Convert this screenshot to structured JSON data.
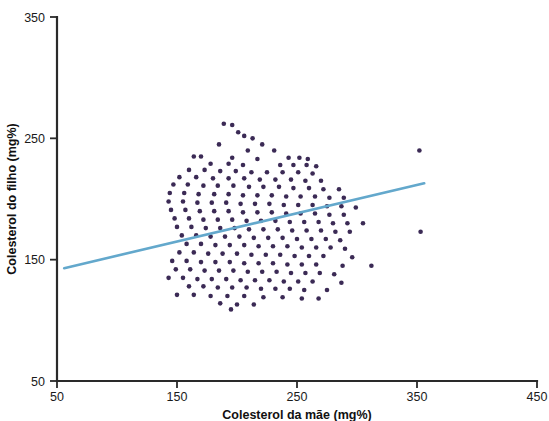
{
  "chart_data": {
    "type": "scatter",
    "title": "",
    "xlabel": "Colesterol da mãe (mg%)",
    "ylabel": "Colesterol do filho (mg%)",
    "xlim": [
      50,
      450
    ],
    "ylim": [
      50,
      350
    ],
    "xticks": [
      50,
      150,
      250,
      350,
      450
    ],
    "yticks": [
      50,
      150,
      250,
      350
    ],
    "xticklabels": [
      "50",
      "150",
      "250",
      "350",
      "450"
    ],
    "yticklabels": [
      "50",
      "150",
      "250",
      "350"
    ],
    "grid": false,
    "legend": false,
    "point_color": "#3b2a55",
    "point_radius": 2.3,
    "series": [
      {
        "name": "Colesterol mãe vs filho",
        "marker": "circle",
        "color": "#3b2a55",
        "points": [
          [
            189,
            262
          ],
          [
            196,
            261
          ],
          [
            201,
            255
          ],
          [
            206,
            252
          ],
          [
            213,
            250
          ],
          [
            185,
            245
          ],
          [
            221,
            245
          ],
          [
            209,
            240
          ],
          [
            231,
            240
          ],
          [
            352,
            240
          ],
          [
            164,
            235
          ],
          [
            170,
            235
          ],
          [
            196,
            234
          ],
          [
            217,
            233
          ],
          [
            243,
            234
          ],
          [
            252,
            234
          ],
          [
            259,
            233
          ],
          [
            178,
            229
          ],
          [
            193,
            229
          ],
          [
            205,
            228
          ],
          [
            236,
            228
          ],
          [
            247,
            228
          ],
          [
            258,
            228
          ],
          [
            266,
            227
          ],
          [
            160,
            224
          ],
          [
            173,
            224
          ],
          [
            186,
            223
          ],
          [
            199,
            223
          ],
          [
            212,
            222
          ],
          [
            225,
            222
          ],
          [
            238,
            222
          ],
          [
            251,
            222
          ],
          [
            263,
            221
          ],
          [
            152,
            218
          ],
          [
            166,
            218
          ],
          [
            180,
            217
          ],
          [
            193,
            217
          ],
          [
            206,
            217
          ],
          [
            219,
            216
          ],
          [
            232,
            216
          ],
          [
            245,
            216
          ],
          [
            257,
            215
          ],
          [
            270,
            215
          ],
          [
            147,
            212
          ],
          [
            159,
            212
          ],
          [
            172,
            211
          ],
          [
            184,
            211
          ],
          [
            197,
            211
          ],
          [
            210,
            210
          ],
          [
            222,
            210
          ],
          [
            235,
            210
          ],
          [
            247,
            209
          ],
          [
            260,
            209
          ],
          [
            272,
            208
          ],
          [
            285,
            208
          ],
          [
            144,
            205
          ],
          [
            156,
            205
          ],
          [
            168,
            204
          ],
          [
            181,
            204
          ],
          [
            193,
            204
          ],
          [
            205,
            203
          ],
          [
            217,
            203
          ],
          [
            229,
            203
          ],
          [
            241,
            202
          ],
          [
            253,
            202
          ],
          [
            265,
            202
          ],
          [
            277,
            201
          ],
          [
            289,
            201
          ],
          [
            143,
            198
          ],
          [
            155,
            198
          ],
          [
            167,
            197
          ],
          [
            179,
            197
          ],
          [
            191,
            197
          ],
          [
            203,
            196
          ],
          [
            215,
            196
          ],
          [
            227,
            196
          ],
          [
            239,
            195
          ],
          [
            251,
            195
          ],
          [
            263,
            195
          ],
          [
            275,
            194
          ],
          [
            287,
            194
          ],
          [
            299,
            193
          ],
          [
            145,
            191
          ],
          [
            157,
            191
          ],
          [
            169,
            190
          ],
          [
            181,
            190
          ],
          [
            193,
            190
          ],
          [
            205,
            189
          ],
          [
            217,
            189
          ],
          [
            229,
            189
          ],
          [
            241,
            188
          ],
          [
            253,
            188
          ],
          [
            265,
            188
          ],
          [
            277,
            187
          ],
          [
            289,
            187
          ],
          [
            148,
            184
          ],
          [
            160,
            184
          ],
          [
            172,
            183
          ],
          [
            184,
            183
          ],
          [
            196,
            183
          ],
          [
            208,
            182
          ],
          [
            220,
            182
          ],
          [
            232,
            182
          ],
          [
            244,
            181
          ],
          [
            256,
            181
          ],
          [
            268,
            181
          ],
          [
            280,
            180
          ],
          [
            292,
            180
          ],
          [
            305,
            180
          ],
          [
            150,
            177
          ],
          [
            162,
            177
          ],
          [
            174,
            176
          ],
          [
            186,
            176
          ],
          [
            198,
            176
          ],
          [
            210,
            175
          ],
          [
            222,
            175
          ],
          [
            234,
            175
          ],
          [
            246,
            174
          ],
          [
            258,
            174
          ],
          [
            270,
            174
          ],
          [
            282,
            173
          ],
          [
            294,
            173
          ],
          [
            353,
            173
          ],
          [
            154,
            170
          ],
          [
            166,
            170
          ],
          [
            178,
            169
          ],
          [
            190,
            169
          ],
          [
            202,
            169
          ],
          [
            214,
            168
          ],
          [
            226,
            168
          ],
          [
            238,
            168
          ],
          [
            250,
            167
          ],
          [
            262,
            167
          ],
          [
            274,
            167
          ],
          [
            286,
            166
          ],
          [
            158,
            163
          ],
          [
            170,
            163
          ],
          [
            182,
            162
          ],
          [
            194,
            162
          ],
          [
            206,
            162
          ],
          [
            218,
            161
          ],
          [
            230,
            161
          ],
          [
            242,
            161
          ],
          [
            254,
            160
          ],
          [
            266,
            160
          ],
          [
            278,
            160
          ],
          [
            290,
            159
          ],
          [
            152,
            156
          ],
          [
            164,
            156
          ],
          [
            176,
            155
          ],
          [
            188,
            155
          ],
          [
            200,
            155
          ],
          [
            212,
            154
          ],
          [
            224,
            154
          ],
          [
            236,
            154
          ],
          [
            248,
            153
          ],
          [
            260,
            153
          ],
          [
            272,
            153
          ],
          [
            296,
            152
          ],
          [
            146,
            149
          ],
          [
            158,
            149
          ],
          [
            170,
            148
          ],
          [
            182,
            148
          ],
          [
            194,
            148
          ],
          [
            206,
            147
          ],
          [
            218,
            147
          ],
          [
            230,
            147
          ],
          [
            242,
            146
          ],
          [
            254,
            146
          ],
          [
            266,
            146
          ],
          [
            288,
            145
          ],
          [
            312,
            145
          ],
          [
            149,
            142
          ],
          [
            161,
            142
          ],
          [
            173,
            141
          ],
          [
            185,
            141
          ],
          [
            197,
            141
          ],
          [
            209,
            140
          ],
          [
            221,
            140
          ],
          [
            233,
            140
          ],
          [
            245,
            139
          ],
          [
            257,
            139
          ],
          [
            269,
            139
          ],
          [
            281,
            138
          ],
          [
            143,
            135
          ],
          [
            155,
            135
          ],
          [
            167,
            134
          ],
          [
            179,
            134
          ],
          [
            191,
            134
          ],
          [
            203,
            133
          ],
          [
            215,
            133
          ],
          [
            227,
            133
          ],
          [
            239,
            132
          ],
          [
            251,
            132
          ],
          [
            263,
            132
          ],
          [
            287,
            131
          ],
          [
            160,
            128
          ],
          [
            172,
            128
          ],
          [
            184,
            127
          ],
          [
            196,
            127
          ],
          [
            208,
            127
          ],
          [
            220,
            126
          ],
          [
            232,
            126
          ],
          [
            244,
            126
          ],
          [
            256,
            125
          ],
          [
            275,
            125
          ],
          [
            150,
            121
          ],
          [
            164,
            121
          ],
          [
            178,
            120
          ],
          [
            192,
            120
          ],
          [
            206,
            120
          ],
          [
            222,
            119
          ],
          [
            238,
            119
          ],
          [
            254,
            118
          ],
          [
            268,
            118
          ],
          [
            186,
            114
          ],
          [
            200,
            113
          ],
          [
            214,
            113
          ],
          [
            195,
            109
          ]
        ]
      }
    ],
    "trendline": {
      "color": "#63a8cc",
      "width": 2.6,
      "x_start": 56,
      "y_start": 143,
      "x_end": 356,
      "y_end": 213
    }
  },
  "axes": {
    "x_axis_name": "x-axis",
    "y_axis_name": "y-axis"
  }
}
